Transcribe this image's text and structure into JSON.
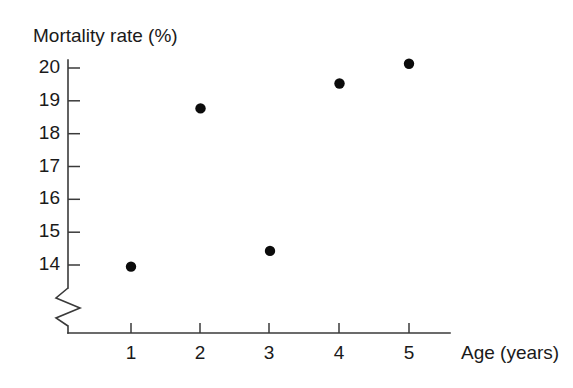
{
  "chart_data": {
    "type": "scatter",
    "title": "",
    "ylabel": "Mortality rate (%)",
    "xlabel": "Age (years)",
    "x": [
      1,
      2,
      3,
      4,
      5
    ],
    "values": [
      13.95,
      18.77,
      14.43,
      19.53,
      20.13
    ],
    "series": [
      {
        "name": "Mortality rate",
        "points": [
          {
            "x": 1,
            "y": 13.95
          },
          {
            "x": 2,
            "y": 18.77
          },
          {
            "x": 3,
            "y": 14.43
          },
          {
            "x": 4,
            "y": 19.53
          },
          {
            "x": 5,
            "y": 20.13
          }
        ],
        "marker": "filled-circle",
        "color": "#0b0b0b"
      }
    ],
    "xlim": [
      0.45,
      5.6
    ],
    "ylim": [
      13.6,
      20.4
    ],
    "xticks": [
      1,
      2,
      3,
      4,
      5
    ],
    "xticklabels": [
      "1",
      "2",
      "3",
      "4",
      "5"
    ],
    "yticks": [
      14,
      15,
      16,
      17,
      18,
      19,
      20
    ],
    "yticklabels": [
      "14",
      "15",
      "16",
      "17",
      "18",
      "19",
      "20"
    ],
    "grid": false,
    "legend": null,
    "legend_position": "none",
    "y_axis_break": true,
    "annotations": []
  },
  "axes": {
    "y_title": "Mortality rate (%)",
    "x_title": "Age (years)",
    "y_tick_labels": [
      "20",
      "19",
      "18",
      "17",
      "16",
      "15",
      "14"
    ],
    "x_tick_labels": [
      "1",
      "2",
      "3",
      "4",
      "5"
    ],
    "break_symbol_name": "axis-break-zigzag"
  },
  "colors": {
    "background": "#ffffff",
    "axis": "#3a3a3a",
    "marker": "#0b0b0b",
    "text": "#1a1a1a"
  }
}
